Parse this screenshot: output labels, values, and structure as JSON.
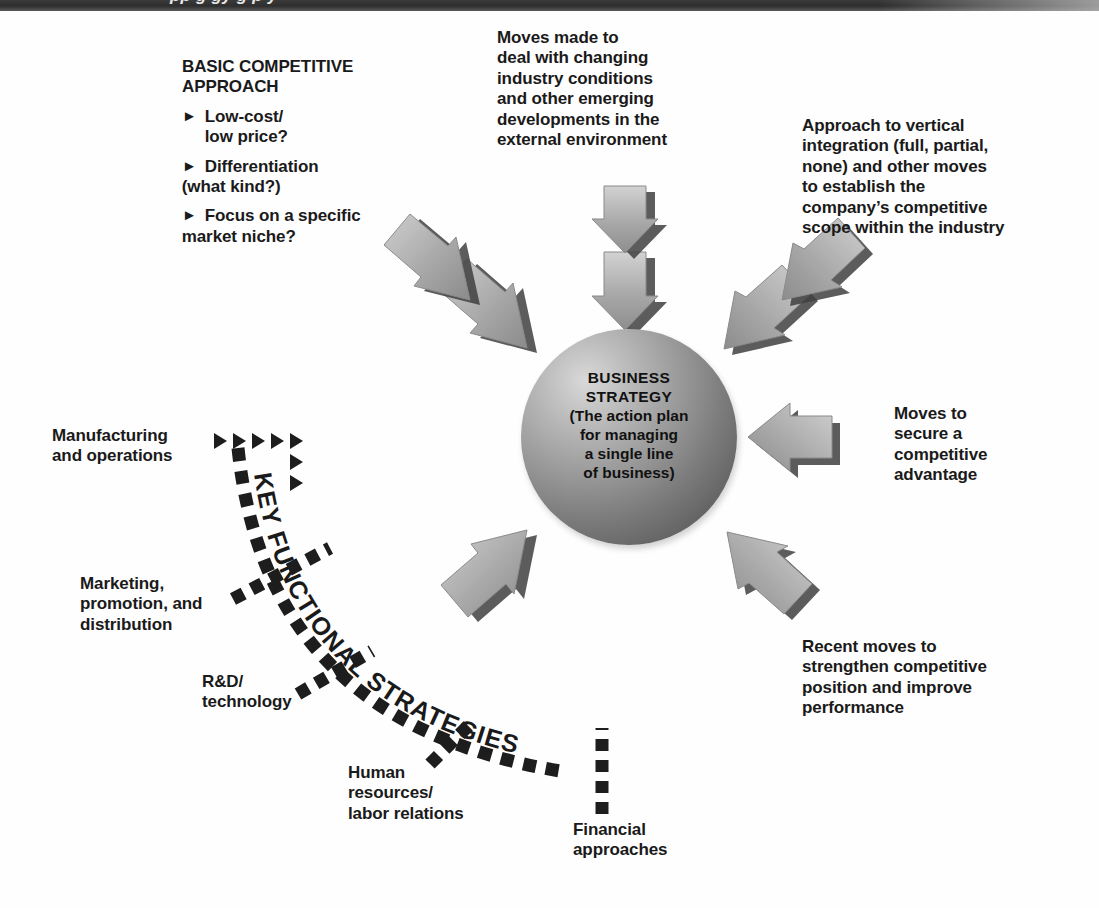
{
  "header": {
    "clipped_title": "pp  g  gy         g                    p      y"
  },
  "center": {
    "lines": [
      "BUSINESS",
      "STRATEGY",
      "(The action plan",
      "for managing",
      "a single line",
      "of business)"
    ]
  },
  "band": {
    "label": "KEY FUNCTIONAL STRATEGIES"
  },
  "callouts": {
    "basic_competitive_approach": {
      "heading": [
        "BASIC COMPETITIVE",
        "APPROACH"
      ],
      "bullets": [
        [
          "Low-cost/",
          "low price?"
        ],
        [
          "Differentiation",
          "(what kind?)"
        ],
        [
          "Focus on a specific",
          "market niche?"
        ]
      ],
      "bullet_marker": "►"
    },
    "external_environment": {
      "lines": [
        "Moves made to",
        "deal with changing",
        "industry conditions",
        "and other emerging",
        "developments in the",
        "external environment"
      ]
    },
    "vertical_integration": {
      "lines": [
        "Approach to vertical",
        "integration (full, partial,",
        "none) and other moves",
        "to establish the",
        "company’s competitive",
        "scope within the industry"
      ]
    },
    "competitive_advantage": {
      "lines": [
        "Moves to",
        "secure a",
        "competitive",
        "advantage"
      ]
    },
    "recent_moves": {
      "lines": [
        "Recent moves to",
        "strengthen competitive",
        "position and improve",
        "performance"
      ]
    },
    "manufacturing": {
      "lines": [
        "Manufacturing",
        "and operations"
      ]
    },
    "marketing": {
      "lines": [
        "Marketing,",
        "promotion, and",
        "distribution"
      ]
    },
    "rnd": {
      "lines": [
        "R&D/",
        "technology"
      ]
    },
    "human_resources": {
      "lines": [
        "Human",
        "resources/",
        "labor relations"
      ]
    },
    "financial": {
      "lines": [
        "Financial",
        "approaches"
      ]
    }
  },
  "colors": {
    "background": "#fefefe",
    "header_bar": "#2e2e2e",
    "text": "#1a1a1a",
    "sphere_light": "#d9d9d9",
    "sphere_dark": "#565656",
    "arrow_face": "#b4b4b4",
    "arrow_shadow": "#3b3b3b",
    "triangle": "#1d1d1d"
  },
  "icons": {
    "bullet": "triangle-right-icon",
    "arrow_inward": "arrow-3d-icon",
    "pointer": "triangle-pointer-icon"
  }
}
